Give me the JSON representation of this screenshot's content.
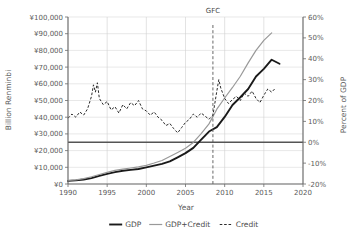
{
  "chart_data": {
    "type": "line",
    "title": "",
    "xlabel": "Year",
    "ylabel": "Billion Renminbi",
    "ylabel_right": "Percent of GDP",
    "xlim": [
      1990,
      2020
    ],
    "xticks": [
      "1990",
      "1995",
      "2000",
      "2005",
      "2010",
      "2015",
      "2020"
    ],
    "xtick_values": [
      1990,
      1995,
      2000,
      2005,
      2010,
      2015,
      2020
    ],
    "ylim": [
      0,
      100000
    ],
    "yticks": [
      "¥0",
      "¥10,000",
      "¥20,000",
      "¥30,000",
      "¥40,000",
      "¥50,000",
      "¥60,000",
      "¥70,000",
      "¥80,000",
      "¥90,000",
      "¥100,000"
    ],
    "ytick_values": [
      0,
      10000,
      20000,
      30000,
      40000,
      50000,
      60000,
      70000,
      80000,
      90000,
      100000
    ],
    "ylim_right": [
      -20,
      60
    ],
    "yticks_right": [
      "-20%",
      "-10%",
      "0%",
      "10%",
      "20%",
      "30%",
      "40%",
      "50%",
      "60%"
    ],
    "ytick_values_right": [
      -20,
      -10,
      0,
      10,
      20,
      30,
      40,
      50,
      60
    ],
    "grid": true,
    "legend_position": "bottom",
    "annotations": [
      {
        "label": "GFC",
        "x": 2008.5
      }
    ],
    "series": [
      {
        "name": "GDP",
        "style": "solid-thick",
        "color": "#1a1a1a",
        "axis": "left",
        "x": [
          1990,
          1991,
          1992,
          1993,
          1994,
          1995,
          1996,
          1997,
          1998,
          1999,
          2000,
          2001,
          2002,
          2003,
          2004,
          2005,
          2006,
          2007,
          2008,
          2009,
          2010,
          2011,
          2012,
          2013,
          2014,
          2015,
          2016,
          2017
        ],
        "values": [
          1887,
          2179,
          2693,
          3533,
          4820,
          6079,
          7118,
          7897,
          8440,
          8968,
          9921,
          10966,
          12033,
          13582,
          15988,
          18494,
          21631,
          26581,
          31405,
          34090,
          40151,
          47310,
          51947,
          56885,
          64397,
          68905,
          74413,
          72000
        ]
      },
      {
        "name": "GDP+Credit",
        "style": "solid-thin",
        "color": "#999999",
        "axis": "left",
        "x": [
          1990,
          1991,
          1992,
          1993,
          1994,
          1995,
          1996,
          1997,
          1998,
          1999,
          2000,
          2001,
          2002,
          2003,
          2004,
          2005,
          2006,
          2007,
          2008,
          2009,
          2010,
          2011,
          2012,
          2013,
          2014,
          2015,
          2016
        ],
        "values": [
          2100,
          2480,
          3180,
          4320,
          5680,
          6980,
          8150,
          8950,
          9600,
          10250,
          11200,
          12550,
          14100,
          16500,
          18900,
          21400,
          24900,
          30200,
          36000,
          44800,
          51500,
          57800,
          64500,
          72500,
          80000,
          86000,
          90500
        ]
      },
      {
        "name": "Credit",
        "style": "dashed",
        "color": "#2b2b2b",
        "axis": "right",
        "x": [
          1990.0,
          1990.5,
          1991.0,
          1991.5,
          1992.0,
          1992.5,
          1993.0,
          1993.25,
          1993.5,
          1993.75,
          1994.0,
          1994.5,
          1995.0,
          1995.5,
          1996.0,
          1996.5,
          1997.0,
          1997.5,
          1998.0,
          1998.5,
          1999.0,
          1999.5,
          2000.0,
          2000.5,
          2001.0,
          2001.5,
          2002.0,
          2002.5,
          2003.0,
          2003.5,
          2004.0,
          2004.5,
          2005.0,
          2005.5,
          2006.0,
          2006.5,
          2007.0,
          2007.5,
          2008.0,
          2008.5,
          2009.0,
          2009.25,
          2009.5,
          2010.0,
          2010.5,
          2011.0,
          2011.5,
          2012.0,
          2012.5,
          2013.0,
          2013.5,
          2014.0,
          2014.5,
          2015.0,
          2015.5,
          2016.0,
          2016.5
        ],
        "values": [
          11.5,
          13.5,
          12.0,
          14.5,
          13.0,
          16.0,
          22.0,
          27.5,
          24.0,
          28.5,
          21.0,
          18.0,
          19.5,
          15.5,
          17.0,
          14.0,
          18.0,
          16.0,
          19.0,
          17.5,
          20.0,
          16.0,
          15.0,
          13.0,
          14.5,
          12.0,
          10.5,
          8.0,
          9.0,
          6.5,
          4.5,
          7.0,
          9.5,
          11.0,
          13.5,
          12.0,
          14.0,
          12.5,
          11.0,
          13.0,
          24.5,
          30.0,
          26.0,
          21.0,
          18.5,
          20.5,
          22.0,
          20.0,
          23.5,
          22.0,
          24.5,
          21.0,
          19.0,
          22.5,
          25.5,
          24.0,
          26.0
        ]
      }
    ]
  },
  "legend": {
    "items": [
      {
        "label": "GDP",
        "style": "solid-thick"
      },
      {
        "label": "GDP+Credit",
        "style": "solid-thin"
      },
      {
        "label": "Credit",
        "style": "dashed"
      }
    ]
  }
}
